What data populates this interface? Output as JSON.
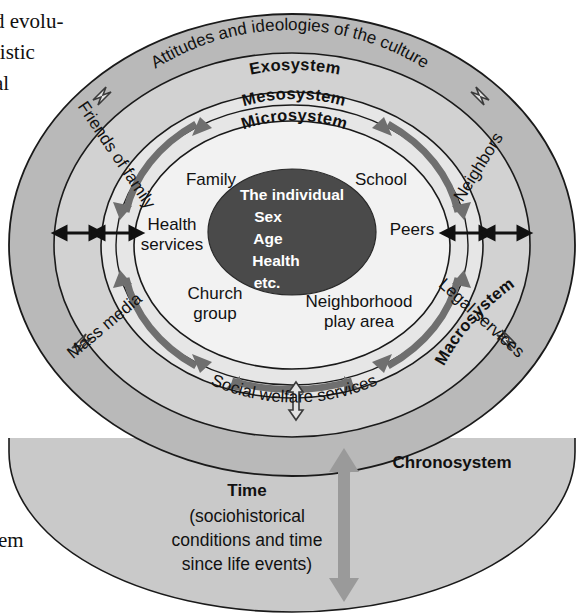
{
  "page": {
    "margin_text_top": [
      "d evolu-",
      "listic",
      "al"
    ],
    "margin_text_bottom": [
      "it",
      "stem"
    ]
  },
  "colors": {
    "macrosystem_fill": "#b9b9b9",
    "exosystem_fill": "#d2d2d2",
    "mesosystem_fill": "#e6e6e6",
    "microsystem_fill": "#efefef",
    "individual_fill": "#4a4a4a",
    "chronosystem_fill": "#c9c9c9",
    "meso_arrow": "#6b6b6b",
    "time_arrow": "#9a9a9a",
    "outline": "#1a1a1a"
  },
  "rings": {
    "macrosystem": {
      "name": "Macrosystem",
      "curved_label": "Attitudes and ideologies of the culture"
    },
    "exosystem": {
      "name": "Exosystem",
      "items": [
        "Friends of family",
        "Neighbors",
        "Mass media",
        "Legal services",
        "Social welfare services"
      ]
    },
    "mesosystem": {
      "name": "Mesosystem"
    },
    "microsystem": {
      "name": "Microsystem",
      "items": [
        "Family",
        "School",
        "Health",
        "services",
        "Peers",
        "Church",
        "group",
        "Neighborhood",
        "play area"
      ]
    }
  },
  "individual": {
    "lines": [
      "The individual",
      "Sex",
      "Age",
      "Health",
      "etc."
    ]
  },
  "chronosystem": {
    "name": "Chronosystem",
    "time_label": "Time",
    "time_detail": [
      "(sociohistorical",
      "conditions and time",
      "since life events)"
    ]
  }
}
